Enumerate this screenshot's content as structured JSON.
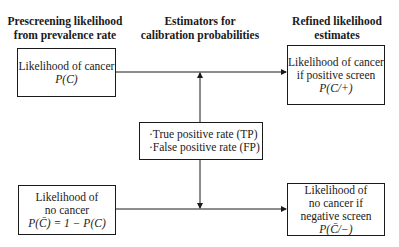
{
  "headers": {
    "left": [
      "Prescreening likelihood",
      "from prevalence rate"
    ],
    "center": [
      "Estimators for",
      "calibration probabilities"
    ],
    "right": [
      "Refined likelihood",
      "estimates"
    ]
  },
  "boxes": {
    "prior_cancer": {
      "lines": [
        "Likelihood of cancer"
      ],
      "formula": "P(C)"
    },
    "prior_no_cancer": {
      "lines": [
        "Likelihood of",
        "no cancer"
      ],
      "formula": "P(C̄) = 1 − P(C)"
    },
    "estimators": {
      "items": [
        "·True positive rate (TP)",
        "·False positive rate (FP)"
      ]
    },
    "posterior_cancer": {
      "lines": [
        "Likelihood of cancer",
        "if positive screen"
      ],
      "formula": "P(C/+)"
    },
    "posterior_no_cancer": {
      "lines": [
        "Likelihood of",
        "no cancer if",
        "negative screen"
      ],
      "formula": "P(C̄/−)"
    }
  },
  "colors": {
    "line": "#1a1a1a",
    "background": "#ffffff"
  }
}
